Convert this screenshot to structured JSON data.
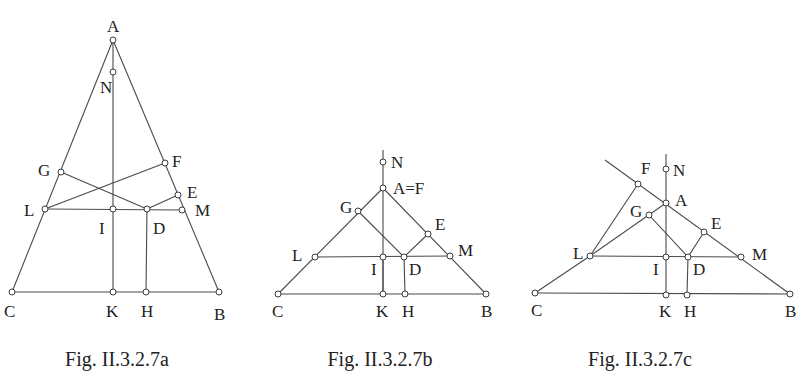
{
  "figures": [
    {
      "id": "a",
      "caption": "Fig. II.3.2.7a",
      "caption_pos": [
        117,
        366
      ],
      "points": {
        "A": [
          113,
          40
        ],
        "N": [
          113,
          72
        ],
        "G": [
          61,
          172
        ],
        "F": [
          165,
          163
        ],
        "E": [
          178,
          195
        ],
        "L": [
          45,
          209
        ],
        "I": [
          113,
          209
        ],
        "D": [
          147,
          209
        ],
        "M": [
          182,
          210
        ],
        "C": [
          12,
          292
        ],
        "K": [
          113,
          292
        ],
        "H": [
          146,
          292
        ],
        "B": [
          219,
          292
        ]
      },
      "segments": [
        [
          "A",
          "C"
        ],
        [
          "A",
          "B"
        ],
        [
          "C",
          "B"
        ],
        [
          "A",
          "K"
        ],
        [
          "L",
          "M"
        ],
        [
          "G",
          "D"
        ],
        [
          "L",
          "F"
        ],
        [
          "D",
          "E"
        ],
        [
          "D",
          "H"
        ]
      ],
      "extra_lines": [],
      "labels": [
        {
          "text": "A",
          "x": 107,
          "y": 32
        },
        {
          "text": "N",
          "x": 100,
          "y": 93
        },
        {
          "text": "G",
          "x": 38,
          "y": 176
        },
        {
          "text": "F",
          "x": 172,
          "y": 167
        },
        {
          "text": "E",
          "x": 187,
          "y": 198
        },
        {
          "text": "L",
          "x": 24,
          "y": 216
        },
        {
          "text": "M",
          "x": 195,
          "y": 216
        },
        {
          "text": "I",
          "x": 99,
          "y": 234
        },
        {
          "text": "D",
          "x": 153,
          "y": 234
        },
        {
          "text": "C",
          "x": 4,
          "y": 317
        },
        {
          "text": "K",
          "x": 106,
          "y": 317
        },
        {
          "text": "H",
          "x": 141,
          "y": 317
        },
        {
          "text": "B",
          "x": 214,
          "y": 320
        }
      ]
    },
    {
      "id": "b",
      "caption": "Fig. II.3.2.7b",
      "caption_pos": [
        380,
        366
      ],
      "points": {
        "N": [
          383,
          162
        ],
        "A=F": [
          383,
          188
        ],
        "G": [
          358,
          211
        ],
        "E": [
          428,
          234
        ],
        "L": [
          315,
          257
        ],
        "I": [
          383,
          257
        ],
        "D": [
          404,
          257
        ],
        "M": [
          450,
          256
        ],
        "C": [
          278,
          294
        ],
        "K": [
          383,
          294
        ],
        "H": [
          405,
          294
        ],
        "B": [
          486,
          294
        ]
      },
      "segments": [
        [
          "A=F",
          "C"
        ],
        [
          "A=F",
          "B"
        ],
        [
          "C",
          "B"
        ],
        [
          "L",
          "M"
        ],
        [
          "G",
          "D"
        ],
        [
          "D",
          "E"
        ],
        [
          "D",
          "H"
        ],
        [
          "I",
          "K"
        ]
      ],
      "extra_lines": [
        [
          383,
          150,
          383,
          294
        ]
      ],
      "labels": [
        {
          "text": "N",
          "x": 391,
          "y": 168
        },
        {
          "text": "A=F",
          "x": 393,
          "y": 194
        },
        {
          "text": "G",
          "x": 340,
          "y": 213
        },
        {
          "text": "E",
          "x": 435,
          "y": 230
        },
        {
          "text": "L",
          "x": 292,
          "y": 261
        },
        {
          "text": "M",
          "x": 458,
          "y": 256
        },
        {
          "text": "I",
          "x": 371,
          "y": 275
        },
        {
          "text": "D",
          "x": 409,
          "y": 275
        },
        {
          "text": "C",
          "x": 272,
          "y": 317
        },
        {
          "text": "K",
          "x": 376,
          "y": 317
        },
        {
          "text": "H",
          "x": 402,
          "y": 317
        },
        {
          "text": "B",
          "x": 481,
          "y": 317
        }
      ]
    },
    {
      "id": "c",
      "caption": "Fig. II.3.2.7c",
      "caption_pos": [
        640,
        366
      ],
      "points": {
        "F": [
          638,
          184
        ],
        "N": [
          666,
          169
        ],
        "A": [
          666,
          203
        ],
        "G": [
          649,
          215
        ],
        "E": [
          704,
          232
        ],
        "L": [
          590,
          256
        ],
        "I": [
          666,
          257
        ],
        "D": [
          688,
          257
        ],
        "M": [
          741,
          257
        ],
        "C": [
          535,
          293
        ],
        "K": [
          666,
          295
        ],
        "H": [
          687,
          295
        ],
        "B": [
          790,
          294
        ]
      },
      "segments": [
        [
          "L",
          "C"
        ],
        [
          "C",
          "B"
        ],
        [
          "L",
          "F"
        ],
        [
          "L",
          "A"
        ],
        [
          "L",
          "M"
        ],
        [
          "G",
          "D"
        ],
        [
          "D",
          "E"
        ],
        [
          "D",
          "H"
        ]
      ],
      "extra_lines": [
        [
          605,
          160,
          790,
          294
        ],
        [
          666,
          154,
          666,
          295
        ]
      ],
      "labels": [
        {
          "text": "F",
          "x": 641,
          "y": 174
        },
        {
          "text": "N",
          "x": 673,
          "y": 176
        },
        {
          "text": "A",
          "x": 675,
          "y": 206
        },
        {
          "text": "G",
          "x": 630,
          "y": 217
        },
        {
          "text": "E",
          "x": 711,
          "y": 229
        },
        {
          "text": "L",
          "x": 573,
          "y": 259
        },
        {
          "text": "M",
          "x": 752,
          "y": 260
        },
        {
          "text": "I",
          "x": 653,
          "y": 275
        },
        {
          "text": "D",
          "x": 693,
          "y": 275
        },
        {
          "text": "C",
          "x": 531,
          "y": 316
        },
        {
          "text": "K",
          "x": 659,
          "y": 317
        },
        {
          "text": "H",
          "x": 684,
          "y": 317
        },
        {
          "text": "B",
          "x": 785,
          "y": 317
        }
      ]
    }
  ]
}
